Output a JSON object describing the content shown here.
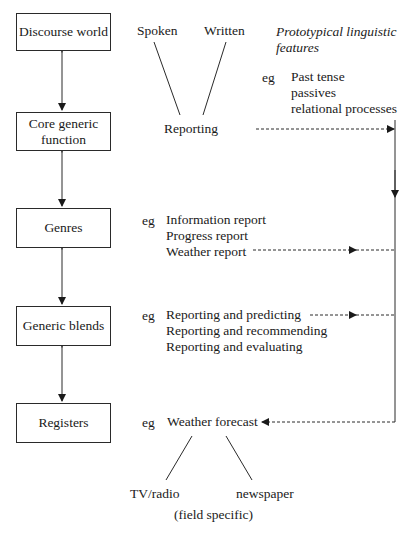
{
  "levels": [
    {
      "label": "Discourse world"
    },
    {
      "label": "Core generic function"
    },
    {
      "label": "Genres"
    },
    {
      "label": "Generic blends"
    },
    {
      "label": "Registers"
    }
  ],
  "modes": {
    "spoken": "Spoken",
    "written": "Written"
  },
  "features": {
    "heading": "Prototypical linguistic features",
    "heading_line1": "Prototypical linguistic",
    "heading_line2": "features",
    "eg": "eg",
    "items": [
      "Past tense",
      "passives",
      "relational processes"
    ]
  },
  "core_function": {
    "label": "Reporting"
  },
  "genres": {
    "eg": "eg",
    "items": [
      "Information report",
      "Progress report",
      "Weather report"
    ]
  },
  "blends": {
    "eg": "eg",
    "items": [
      "Reporting and predicting",
      "Reporting and recommending",
      "Reporting and evaluating"
    ]
  },
  "registers": {
    "eg": "eg",
    "example": "Weather forecast",
    "branches": [
      "TV/radio",
      "newspaper"
    ],
    "note": "(field specific)"
  },
  "colors": {
    "line": "#2a2a2a",
    "text": "#1a1a1a",
    "background": "#ffffff"
  }
}
